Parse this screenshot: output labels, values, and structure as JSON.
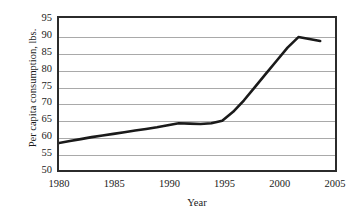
{
  "chart_data": {
    "type": "line",
    "title": "",
    "xlabel": "Year",
    "ylabel": "Per capita consumption, lbs.",
    "xlim": [
      1980,
      2005
    ],
    "ylim": [
      50,
      95
    ],
    "xticks": [
      "1980",
      "1985",
      "1990",
      "1995",
      "2000",
      "2005"
    ],
    "yticks": [
      "95",
      "90",
      "85",
      "80",
      "75",
      "70",
      "65",
      "60",
      "55",
      "50"
    ],
    "grid": true,
    "legend": "none",
    "line_color": "#1a1a1a",
    "grid_color": "#a9a9a9",
    "frame_color": "#2b2b2b",
    "series": [
      {
        "name": "Per capita consumption",
        "x": [
          1980,
          1981,
          1982,
          1983,
          1984,
          1985,
          1986,
          1987,
          1988,
          1989,
          1990,
          1991,
          1992,
          1993,
          1994,
          1995,
          1996,
          1997,
          1998,
          1999,
          2000,
          2001,
          2002,
          2003,
          2004
        ],
        "values": [
          57.0,
          57.6,
          58.2,
          58.8,
          59.3,
          59.8,
          60.3,
          60.8,
          61.3,
          61.8,
          62.4,
          63.0,
          62.9,
          62.8,
          63.0,
          63.8,
          66.5,
          70.0,
          74.0,
          78.0,
          82.0,
          86.0,
          89.2,
          88.6,
          88.0
        ]
      }
    ]
  }
}
